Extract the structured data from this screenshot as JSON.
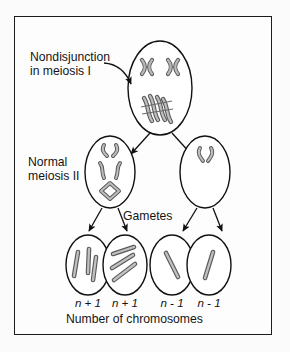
{
  "figure": {
    "title_text": "Nondisjunction in meiosis I",
    "caption": "Number of chromosomes",
    "colors": {
      "frame_border": "#1c1c1c",
      "cell_outline": "#111111",
      "chromosome_fill": "#b3b3b3",
      "chromosome_stroke": "#4a4a4a",
      "arrow": "#111111",
      "background": "#fdfdfd",
      "text": "#141414"
    }
  },
  "labels": {
    "nondisjunction": "Nondisjunction\nin meiosis I",
    "normal_meiosis": "Normal\nmeiosis II",
    "gametes": "Gametes",
    "caption": "Number of chromosomes"
  },
  "gametes": [
    {
      "id": "gamete-1",
      "ploidy": "n + 1",
      "chromosome_count": 3
    },
    {
      "id": "gamete-2",
      "ploidy": "n + 1",
      "chromosome_count": 3
    },
    {
      "id": "gamete-3",
      "ploidy": "n - 1",
      "chromosome_count": 1
    },
    {
      "id": "gamete-4",
      "ploidy": "n - 1",
      "chromosome_count": 1
    }
  ],
  "cells": {
    "parent": {
      "name": "meiosis-I-cell",
      "paired_chromosomes": 2,
      "nondisjunction_cluster": 4
    },
    "secondary_left": {
      "name": "meiosis-II-cell-left",
      "chromosome_groups": 3
    },
    "secondary_right": {
      "name": "meiosis-II-cell-right",
      "chromosome_groups": 1
    }
  },
  "arrows": {
    "pointer": "nondisjunction-pointer-arrow",
    "meiosis_I_split": 2,
    "meiosis_II_split": 4
  }
}
